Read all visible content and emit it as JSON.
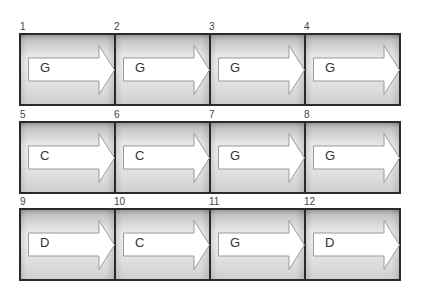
{
  "diagram": {
    "type": "chord-progression-grid",
    "rows": [
      {
        "cells": [
          {
            "number": "1",
            "chord": "G"
          },
          {
            "number": "2",
            "chord": "G"
          },
          {
            "number": "3",
            "chord": "G"
          },
          {
            "number": "4",
            "chord": "G"
          }
        ]
      },
      {
        "cells": [
          {
            "number": "5",
            "chord": "C"
          },
          {
            "number": "6",
            "chord": "C"
          },
          {
            "number": "7",
            "chord": "G"
          },
          {
            "number": "8",
            "chord": "G"
          }
        ]
      },
      {
        "cells": [
          {
            "number": "9",
            "chord": "D"
          },
          {
            "number": "10",
            "chord": "C"
          },
          {
            "number": "11",
            "chord": "G"
          },
          {
            "number": "12",
            "chord": "D"
          }
        ]
      }
    ],
    "icons": {
      "arrow": "right-arrow-icon"
    },
    "colors": {
      "border": "#2a2a2a",
      "cell_fill": "#e6e6e6",
      "arrow_fill": "#ffffff",
      "arrow_stroke": "#9a9a9a",
      "text": "#333333"
    }
  }
}
